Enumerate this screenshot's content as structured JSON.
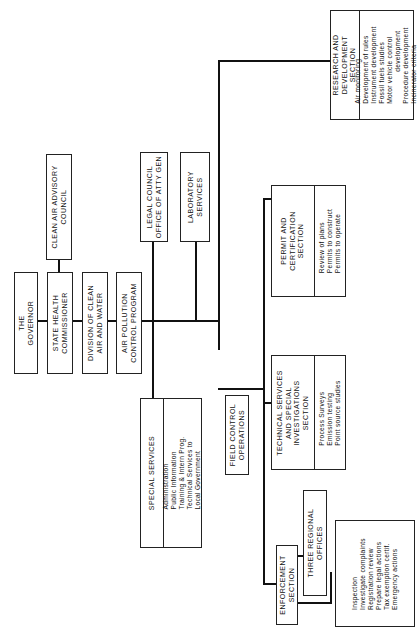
{
  "diagram": {
    "type": "organizational-chart",
    "orientation": "rotated-90-ccw",
    "nodes": {
      "governor": {
        "label": "THE\nGOVERNOR"
      },
      "commissioner": {
        "label": "STATE HEALTH\nCOMMISSIONER"
      },
      "advisory": {
        "label": "CLEAN AIR ADVISORY\nCOUNCIL"
      },
      "division": {
        "label": "DIVISION OF CLEAN\nAIR AND WATER"
      },
      "program": {
        "label": "AIR POLLUTION\nCONTROL PROGRAM"
      },
      "legal": {
        "label": "LEGAL COUNCIL\nOFFICE OF ATTY GEN"
      },
      "laboratory": {
        "label": "LABORATORY\nSERVICES"
      },
      "special": {
        "label": "SPECIAL SERVICES",
        "items": "Administration\nPublic Information\nTraining & Intern Prog.\nTechnical Services to\nLocal Government"
      },
      "field": {
        "label": "FIELD CONTROL\nOPERATIONS"
      },
      "technical": {
        "label": "TECHNICAL SERVICES\nAND SPECIAL\nINVESTIGATIONS\nSECTION",
        "items": "Process Surveys\nEmission testing\nPoint source studies"
      },
      "permit": {
        "label": "PERMIT AND\nCERTIFICATION\nSECTION",
        "items": "Review of plans\nPermits to construct\nPermits to operate"
      },
      "research": {
        "label": "RESEARCH AND\nDEVELOPMENT\nSECTION",
        "items": "Air monitoring\nDevelopment of rules\nInstrument development\nFossil fuels studies\nMotor vehicle control\n               development\nProcedure development\nIncinerator criteria"
      },
      "enforcement": {
        "label": "ENFORCEMENT\nSECTION",
        "items": "Inspection\nInvestigate complaints\nRegistration review\nPrepare legal actions\nTax exemption certif.\nEmergency actions"
      },
      "regional": {
        "label": "THREE REGIONAL\nOFFICES"
      }
    }
  }
}
